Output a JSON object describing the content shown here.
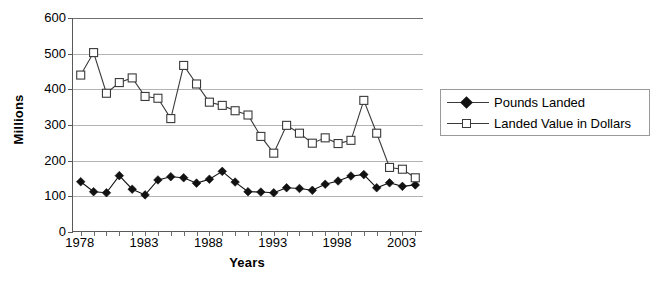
{
  "chart_data": {
    "type": "line",
    "title": "",
    "xlabel": "Years",
    "ylabel": "Millions",
    "xlim": [
      1977.4,
      2004.6
    ],
    "ylim": [
      0,
      600
    ],
    "ytick_values": [
      0,
      100,
      200,
      300,
      400,
      500,
      600
    ],
    "ytick_labels": [
      "0",
      "100",
      "200",
      "300",
      "400",
      "500",
      "600"
    ],
    "xtick_values": [
      1978,
      1983,
      1988,
      1993,
      1998,
      2003
    ],
    "xtick_labels": [
      "1978",
      "1983",
      "1988",
      "1993",
      "1998",
      "2003"
    ],
    "grid": "horizontal",
    "legend_position": "right",
    "x": [
      1978,
      1979,
      1980,
      1981,
      1982,
      1983,
      1984,
      1985,
      1986,
      1987,
      1988,
      1989,
      1990,
      1991,
      1992,
      1993,
      1994,
      1995,
      1996,
      1997,
      1998,
      1999,
      2000,
      2001,
      2002,
      2003,
      2004
    ],
    "series": [
      {
        "name": "Pounds Landed",
        "marker": "filled-diamond",
        "color": "#111111",
        "values": [
          141,
          113,
          110,
          158,
          120,
          104,
          146,
          155,
          152,
          137,
          148,
          170,
          140,
          113,
          112,
          110,
          124,
          122,
          117,
          134,
          143,
          157,
          161,
          124,
          138,
          128,
          132
        ]
      },
      {
        "name": "Landed Value in Dollars",
        "marker": "open-square",
        "color": "#3a3a3a",
        "values": [
          440,
          503,
          389,
          419,
          432,
          380,
          375,
          318,
          467,
          415,
          364,
          355,
          340,
          328,
          268,
          221,
          299,
          277,
          249,
          264,
          248,
          257,
          369,
          277,
          181,
          176,
          152
        ]
      }
    ]
  },
  "axis": {
    "ylabel": "Millions",
    "xlabel": "Years"
  },
  "legend": {
    "items": [
      {
        "label": "Pounds Landed",
        "marker": "filled-diamond"
      },
      {
        "label": "Landed Value in Dollars",
        "marker": "open-square"
      }
    ]
  },
  "caption": {
    "text": ""
  }
}
